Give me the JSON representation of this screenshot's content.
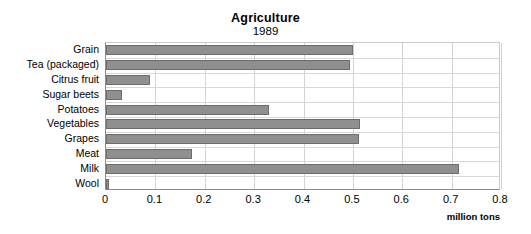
{
  "chart_data": {
    "type": "bar",
    "orientation": "horizontal",
    "title": "Agriculture",
    "subtitle": "1989",
    "xlabel": "million tons",
    "ylabel": "",
    "xlim": [
      0,
      0.8
    ],
    "xticks": [
      "0",
      "0.1",
      "0.2",
      "0.3",
      "0.4",
      "0.5",
      "0.6",
      "0.7",
      "0.8"
    ],
    "xtick_values": [
      0,
      0.1,
      0.2,
      0.3,
      0.4,
      0.5,
      0.6,
      0.7,
      0.8
    ],
    "grid": "both",
    "legend": "none",
    "bar_color": "#8f8f8f",
    "bar_edge_color": "#6d6d6d",
    "categories": [
      "Grain",
      "Tea (packaged)",
      "Citrus fruit",
      "Sugar beets",
      "Potatoes",
      "Vegetables",
      "Grapes",
      "Meat",
      "Milk",
      "Wool"
    ],
    "values": [
      0.5,
      0.495,
      0.09,
      0.033,
      0.33,
      0.515,
      0.513,
      0.175,
      0.715,
      0.005
    ]
  }
}
